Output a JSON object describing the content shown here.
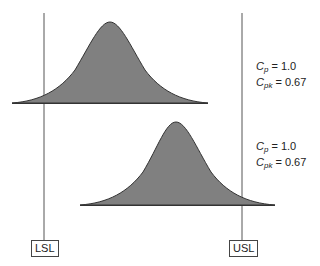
{
  "diagram": {
    "title": "",
    "spec_limits": {
      "lower": {
        "label": "LSL"
      },
      "upper": {
        "label": "USL"
      }
    },
    "distributions": [
      {
        "name": "top",
        "cp_symbol": "C",
        "cp_sub": "p",
        "cp_value": "= 1.0",
        "cpk_symbol": "C",
        "cpk_sub": "pk",
        "cpk_value": "= 0.67",
        "fill": "#808080"
      },
      {
        "name": "bottom",
        "cp_symbol": "C",
        "cp_sub": "p",
        "cp_value": "= 1.0",
        "cpk_symbol": "C",
        "cpk_sub": "pk",
        "cpk_value": "= 0.67",
        "fill": "#808080"
      }
    ]
  }
}
